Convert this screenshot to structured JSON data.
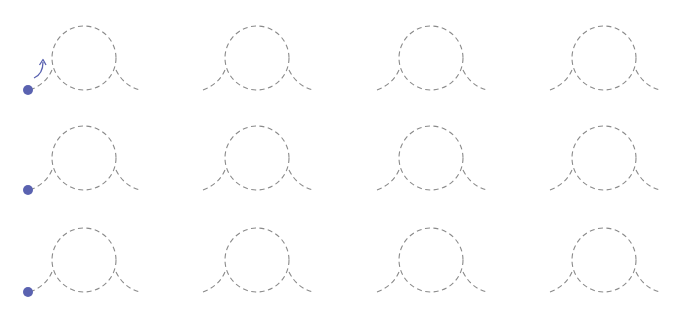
{
  "diagram": {
    "title": "",
    "grid": {
      "rows": 3,
      "cols": 4
    },
    "colors": {
      "track": "#8a8a8a",
      "ball": "#5a62b0",
      "arrow": "#5a62b0",
      "background": "#ffffff"
    },
    "cells": [
      {
        "row": 0,
        "col": 0,
        "dx": 0,
        "dy": 0,
        "ball": true,
        "arrow": true
      },
      {
        "row": 0,
        "col": 1,
        "dx": 173,
        "dy": 0,
        "ball": false,
        "arrow": false
      },
      {
        "row": 0,
        "col": 2,
        "dx": 347,
        "dy": 0,
        "ball": false,
        "arrow": false
      },
      {
        "row": 0,
        "col": 3,
        "dx": 520,
        "dy": 0,
        "ball": false,
        "arrow": false
      },
      {
        "row": 1,
        "col": 0,
        "dx": 0,
        "dy": 100,
        "ball": true,
        "arrow": false
      },
      {
        "row": 1,
        "col": 1,
        "dx": 173,
        "dy": 100,
        "ball": false,
        "arrow": false
      },
      {
        "row": 1,
        "col": 2,
        "dx": 347,
        "dy": 100,
        "ball": false,
        "arrow": false
      },
      {
        "row": 1,
        "col": 3,
        "dx": 520,
        "dy": 100,
        "ball": false,
        "arrow": false
      },
      {
        "row": 2,
        "col": 0,
        "dx": 0,
        "dy": 202,
        "ball": true,
        "arrow": false
      },
      {
        "row": 2,
        "col": 1,
        "dx": 173,
        "dy": 202,
        "ball": false,
        "arrow": false
      },
      {
        "row": 2,
        "col": 2,
        "dx": 347,
        "dy": 202,
        "ball": false,
        "arrow": false
      },
      {
        "row": 2,
        "col": 3,
        "dx": 520,
        "dy": 202,
        "ball": false,
        "arrow": false
      }
    ]
  }
}
